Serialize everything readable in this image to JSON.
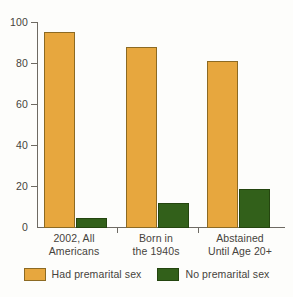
{
  "chart_data": {
    "type": "bar",
    "title": "",
    "subtitle": "",
    "xlabel": "",
    "ylabel": "",
    "ylim": [
      0,
      100
    ],
    "yticks": [
      0,
      20,
      40,
      60,
      80,
      100
    ],
    "ytick_labels": [
      "0",
      "20",
      "40",
      "60",
      "80",
      "100"
    ],
    "grid": false,
    "legend_position": "bottom",
    "categories": [
      "2002, All Americans",
      "Born in the 1940s",
      "Abstained Until Age 20+"
    ],
    "category_lines": [
      [
        "2002, All",
        "Americans"
      ],
      [
        "Born in",
        "the 1940s"
      ],
      [
        "Abstained",
        "Until Age 20+"
      ]
    ],
    "series": [
      {
        "name": "Had premarital sex",
        "color": "#e7a73e",
        "border_color": "#8c6a23",
        "values": [
          95,
          88,
          81
        ]
      },
      {
        "name": "No premarital sex",
        "color": "#32601a",
        "border_color": "#24450f",
        "values": [
          5,
          12,
          19
        ]
      }
    ],
    "axis_color": "#6e6a63",
    "background_color": "#fdfdfb"
  }
}
